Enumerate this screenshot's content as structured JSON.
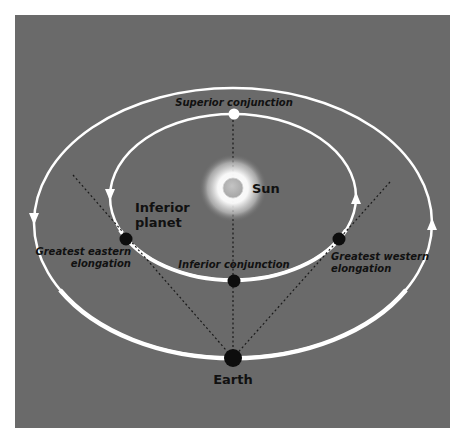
{
  "diagram": {
    "background_color": "#6a6a6a",
    "orbit_color": "#ffffff",
    "labels": {
      "superior_conjunction": "Superior conjunction",
      "sun": "Sun",
      "inferior_planet_line1": "Inferior",
      "inferior_planet_line2": "planet",
      "greatest_eastern_line1": "Greatest eastern",
      "greatest_eastern_line2": "elongation",
      "greatest_western_line1": "Greatest western",
      "greatest_western_line2": "elongation",
      "inferior_conjunction": "Inferior conjunction",
      "earth": "Earth"
    }
  }
}
